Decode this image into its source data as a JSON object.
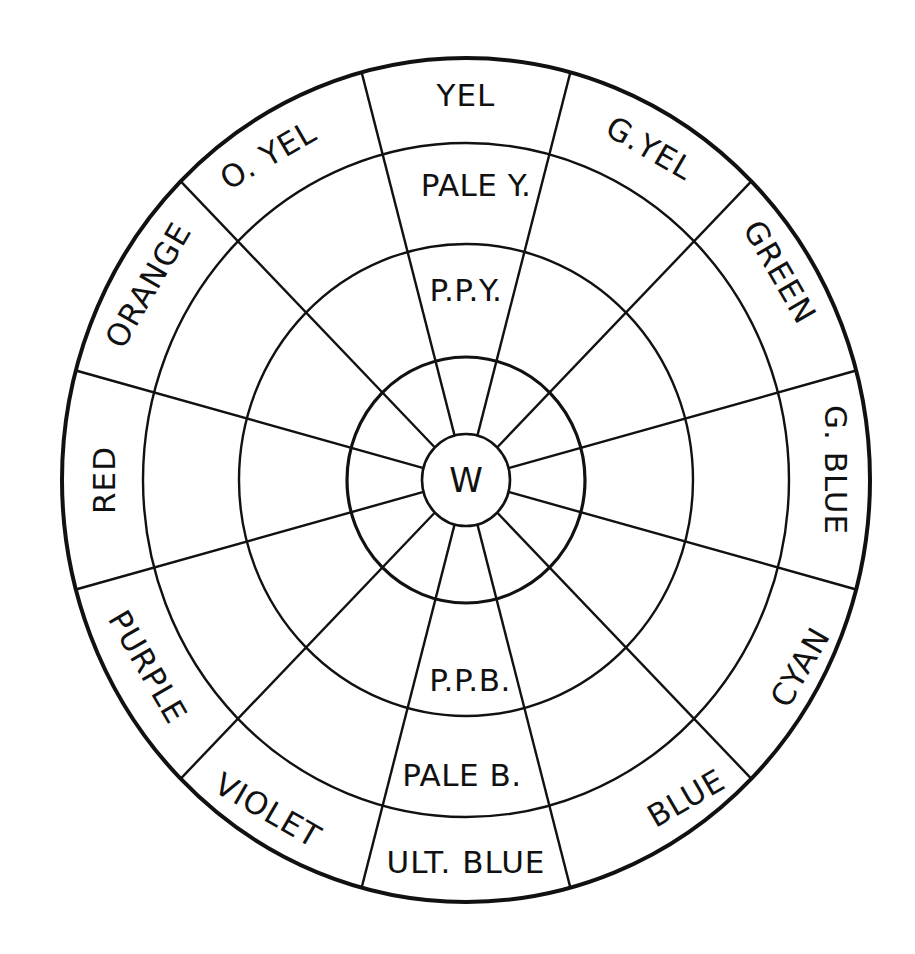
{
  "diagram": {
    "type": "color-wheel",
    "stroke_color": "#111111",
    "background": "#ffffff",
    "center_label": "W",
    "outer_ring_labels": [
      {
        "id": "yel",
        "label": "YEL"
      },
      {
        "id": "g-yel",
        "label": "G.YEL"
      },
      {
        "id": "green",
        "label": "GREEN"
      },
      {
        "id": "g-blue",
        "label": "G. BLUE"
      },
      {
        "id": "cyan",
        "label": "CYAN"
      },
      {
        "id": "blue",
        "label": "BLUE"
      },
      {
        "id": "ult-blue",
        "label": "ULT. BLUE"
      },
      {
        "id": "violet",
        "label": "VIOLET"
      },
      {
        "id": "purple",
        "label": "PURPLE"
      },
      {
        "id": "red",
        "label": "RED"
      },
      {
        "id": "orange",
        "label": "ORANGE"
      },
      {
        "id": "o-yel",
        "label": "O. YEL"
      }
    ],
    "inner_labels": {
      "pale_yellow": "PALE Y.",
      "ppy": "P.P.Y.",
      "ppb": "P.P.B.",
      "pale_blue": "PALE B."
    },
    "rings": 5,
    "segments": 12
  }
}
